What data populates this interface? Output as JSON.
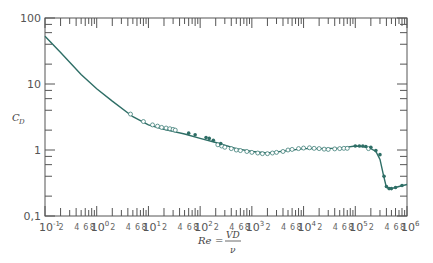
{
  "chart_data": {
    "type": "line",
    "title": "",
    "xlabel": "Re = VD/ν",
    "ylabel": "C_D",
    "xscale": "log",
    "yscale": "log",
    "xlim": [
      0.1,
      1000000
    ],
    "ylim": [
      0.1,
      100
    ],
    "grid": false,
    "legend": null,
    "y_ticks": [
      "0.1",
      "1",
      "10",
      "100"
    ],
    "x_ticks_major": [
      "10^-1",
      "10^0",
      "10^1",
      "10^2",
      "10^3",
      "10^4",
      "10^5",
      "10^6"
    ],
    "x_ticks_minor_labels": [
      "2",
      "4",
      "6",
      "8"
    ],
    "series": [
      {
        "name": "smooth-curve",
        "style": "line",
        "x": [
          0.1,
          0.2,
          0.5,
          1,
          2,
          5,
          10,
          20,
          50,
          100,
          200,
          500,
          1000,
          2000,
          5000,
          10000,
          20000,
          50000,
          100000,
          150000,
          200000,
          250000,
          300000,
          350000,
          400000,
          500000,
          700000,
          1000000
        ],
        "y": [
          53,
          30,
          14,
          8.5,
          5.5,
          3.2,
          2.4,
          2.05,
          1.75,
          1.5,
          1.3,
          1.05,
          0.95,
          0.9,
          0.98,
          1.05,
          1.05,
          1.07,
          1.15,
          1.12,
          1.05,
          0.95,
          0.72,
          0.42,
          0.27,
          0.26,
          0.28,
          0.3
        ]
      },
      {
        "name": "open-circle-data",
        "style": "open-markers",
        "x": [
          4.5,
          8,
          12,
          15,
          18,
          22,
          26,
          30,
          33,
          220,
          260,
          300,
          400,
          500,
          600,
          800,
          1000,
          1300,
          1600,
          2000,
          2500,
          3000,
          4000,
          5000,
          6000,
          8000,
          10000,
          13000,
          16000,
          20000,
          25000,
          30000,
          40000,
          50000,
          60000,
          70000,
          180000
        ],
        "y": [
          3.5,
          2.7,
          2.4,
          2.3,
          2.2,
          2.15,
          2.1,
          2.05,
          2.0,
          1.2,
          1.15,
          1.1,
          1.05,
          1.0,
          0.98,
          0.95,
          0.92,
          0.9,
          0.88,
          0.88,
          0.9,
          0.92,
          0.95,
          1.0,
          1.02,
          1.05,
          1.07,
          1.08,
          1.06,
          1.05,
          1.03,
          1.02,
          1.04,
          1.05,
          1.06,
          1.06,
          1.05
        ]
      },
      {
        "name": "solid-dot-data",
        "style": "filled-markers",
        "x": [
          60,
          80,
          130,
          150,
          180,
          250,
          100000,
          120000,
          140000,
          160000,
          200000,
          250000,
          300000,
          360000,
          400000,
          450000,
          500000,
          600000,
          800000
        ],
        "y": [
          1.8,
          1.7,
          1.55,
          1.5,
          1.4,
          1.25,
          1.15,
          1.15,
          1.15,
          1.13,
          1.1,
          0.98,
          0.85,
          0.4,
          0.28,
          0.26,
          0.26,
          0.27,
          0.29
        ]
      }
    ]
  },
  "labels": {
    "y_axis_symbol": "C",
    "y_axis_sub": "D",
    "x_axis_lhs": "Re",
    "x_axis_eq": "=",
    "x_axis_num": "VD",
    "x_axis_den": "ν"
  },
  "colors": {
    "curve": "#2e6e66",
    "axis": "#555555"
  }
}
